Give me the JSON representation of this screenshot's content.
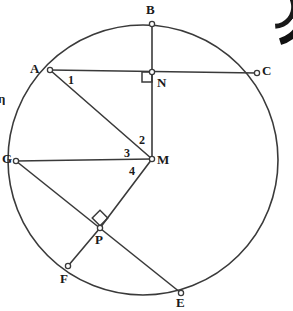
{
  "figure": {
    "kind": "circle-geometry-diagram",
    "stroke_color": "#3a3a3a",
    "label_color": "#1a1a1a",
    "background_color": "#ffffff",
    "circle": {
      "cx": 143,
      "cy": 160,
      "r": 135
    },
    "points": [
      {
        "id": "A",
        "label": "A",
        "x": 50,
        "y": 70,
        "label_x": 30,
        "label_y": 62
      },
      {
        "id": "B",
        "label": "B",
        "x": 152,
        "y": 24,
        "label_x": 146,
        "label_y": 3
      },
      {
        "id": "C",
        "label": "C",
        "x": 257,
        "y": 73,
        "label_x": 262,
        "label_y": 64
      },
      {
        "id": "N",
        "label": "N",
        "x": 152,
        "y": 72,
        "label_x": 157,
        "label_y": 76
      },
      {
        "id": "M",
        "label": "M",
        "x": 152,
        "y": 159,
        "label_x": 157,
        "label_y": 153
      },
      {
        "id": "G",
        "label": "G",
        "x": 16,
        "y": 161,
        "label_x": 2,
        "label_y": 152
      },
      {
        "id": "P",
        "label": "P",
        "x": 100,
        "y": 228,
        "label_x": 95,
        "label_y": 233
      },
      {
        "id": "F",
        "label": "F",
        "x": 68,
        "y": 266,
        "label_x": 60,
        "label_y": 272
      },
      {
        "id": "E",
        "label": "E",
        "x": 181,
        "y": 293,
        "label_x": 176,
        "label_y": 296
      }
    ],
    "segments": [
      {
        "name": "chord-A-C",
        "from": "A",
        "to": "C"
      },
      {
        "name": "chord-B-M",
        "from": "B",
        "to": "M"
      },
      {
        "name": "segment-A-M",
        "from": "A",
        "to": "M"
      },
      {
        "name": "chord-G-M",
        "from": "G",
        "to": "M"
      },
      {
        "name": "chord-G-E",
        "from": "G",
        "to": "E"
      },
      {
        "name": "segment-M-P",
        "from": "M",
        "to": "P"
      },
      {
        "name": "segment-P-F",
        "from": "P",
        "to": "F"
      }
    ],
    "right_angles": [
      {
        "name": "right-angle-at-N",
        "vertex": "N",
        "style": "axis-aligned-square",
        "x": 142,
        "y": 72,
        "size": 10
      },
      {
        "name": "right-angle-at-P",
        "vertex": "P",
        "style": "rotated-square",
        "x": 100,
        "y": 218,
        "size": 11,
        "rotation": 45
      }
    ],
    "angle_labels": [
      {
        "id": "1",
        "label": "1",
        "x": 68,
        "y": 74
      },
      {
        "id": "2",
        "label": "2",
        "x": 139,
        "y": 134
      },
      {
        "id": "3",
        "label": "3",
        "x": 124,
        "y": 147
      },
      {
        "id": "4",
        "label": "4",
        "x": 129,
        "y": 165
      }
    ],
    "edge_artifacts": [
      {
        "name": "cropped-left-character",
        "text": "η",
        "x": -2,
        "y": 92
      }
    ]
  }
}
